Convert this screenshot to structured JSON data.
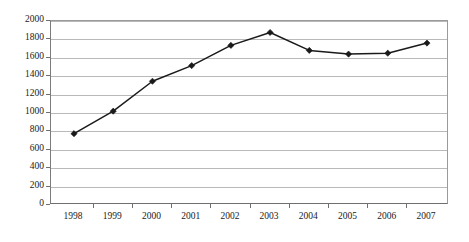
{
  "chart_data": {
    "type": "line",
    "title": "",
    "subtitle": "",
    "xlabel": "",
    "ylabel": "",
    "categories": [
      "1998",
      "1999",
      "2000",
      "2001",
      "2002",
      "2003",
      "2004",
      "2005",
      "2006",
      "2007"
    ],
    "values": [
      775,
      1020,
      1345,
      1515,
      1735,
      1875,
      1680,
      1640,
      1650,
      1760
    ],
    "series": [
      {
        "name": "",
        "values": [
          775,
          1020,
          1345,
          1515,
          1735,
          1875,
          1680,
          1640,
          1650,
          1760
        ]
      }
    ],
    "ylim": [
      0,
      2000
    ],
    "ytick_step": 200,
    "yticks": [
      0,
      200,
      400,
      600,
      800,
      1000,
      1200,
      1400,
      1600,
      1800,
      2000
    ],
    "ytick_labels": [
      "0",
      "200",
      "400",
      "600",
      "800",
      "1000",
      "1200",
      "1400",
      "1600",
      "1800",
      "2000"
    ],
    "xtick_labels": [
      "1998",
      "1999",
      "2000",
      "2001",
      "2002",
      "2003",
      "2004",
      "2005",
      "2006",
      "2007"
    ],
    "grid": true,
    "grid_axis": "y",
    "legend": false,
    "legend_position": "none",
    "marker": "diamond",
    "line_color": "#1a1a1a",
    "marker_color": "#1a1a1a",
    "grid_color": "#b9b9b9",
    "axis_color": "#6f6f6f",
    "background_color": "#ffffff",
    "annotations": []
  }
}
